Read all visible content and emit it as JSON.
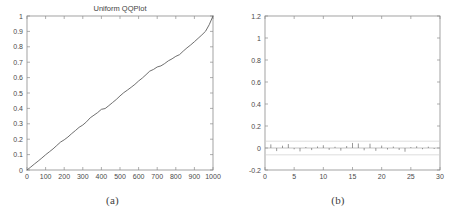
{
  "figure": {
    "panel_a_caption": "(a)",
    "panel_b_caption": "(b)"
  },
  "chart_data": [
    {
      "type": "line",
      "panel": "(a)",
      "title": "Uniform QQPlot",
      "xlabel": "",
      "ylabel": "",
      "xlim": [
        0,
        1000
      ],
      "ylim": [
        0,
        1
      ],
      "grid": false,
      "legend": null,
      "xticks": [
        0,
        100,
        200,
        300,
        400,
        500,
        600,
        700,
        800,
        900,
        1000
      ],
      "xtick_labels": [
        "0",
        "100",
        "200",
        "300",
        "400",
        "500",
        "600",
        "700",
        "800",
        "900",
        "1000"
      ],
      "yticks": [
        0,
        0.1,
        0.2,
        0.3,
        0.4,
        0.5,
        0.6,
        0.7,
        0.8,
        0.9,
        1
      ],
      "ytick_labels": [
        "0",
        "0.1",
        "0.2",
        "0.3",
        "0.4",
        "0.5",
        "0.6",
        "0.7",
        "0.8",
        "0.9",
        "1"
      ],
      "x": [
        0,
        20,
        40,
        60,
        80,
        100,
        120,
        140,
        160,
        180,
        200,
        220,
        240,
        260,
        280,
        300,
        320,
        340,
        360,
        380,
        400,
        420,
        440,
        460,
        480,
        500,
        520,
        540,
        560,
        580,
        600,
        620,
        640,
        660,
        680,
        700,
        720,
        740,
        760,
        780,
        800,
        820,
        840,
        860,
        880,
        900,
        920,
        940,
        960,
        980,
        1000
      ],
      "y": [
        0.0,
        0.019,
        0.039,
        0.058,
        0.078,
        0.099,
        0.118,
        0.137,
        0.159,
        0.181,
        0.196,
        0.214,
        0.236,
        0.256,
        0.277,
        0.292,
        0.313,
        0.339,
        0.356,
        0.373,
        0.394,
        0.399,
        0.418,
        0.438,
        0.458,
        0.481,
        0.502,
        0.519,
        0.537,
        0.556,
        0.578,
        0.597,
        0.619,
        0.642,
        0.653,
        0.669,
        0.676,
        0.691,
        0.709,
        0.722,
        0.738,
        0.749,
        0.772,
        0.793,
        0.812,
        0.833,
        0.855,
        0.877,
        0.901,
        0.944,
        1.0
      ]
    },
    {
      "type": "bar",
      "panel": "(b)",
      "title": "",
      "xlabel": "",
      "ylabel": "",
      "xlim": [
        0,
        30
      ],
      "ylim": [
        -0.2,
        1.2
      ],
      "grid": false,
      "legend": null,
      "xticks": [
        0,
        5,
        10,
        15,
        20,
        25,
        30
      ],
      "xtick_labels": [
        "0",
        "5",
        "10",
        "15",
        "20",
        "25",
        "30"
      ],
      "yticks": [
        -0.2,
        0,
        0.2,
        0.4,
        0.6,
        0.8,
        1,
        1.2
      ],
      "ytick_labels": [
        "-0.2",
        "0",
        "0.2",
        "0.4",
        "0.6",
        "0.8",
        "1",
        "1.2"
      ],
      "confidence_bounds": [
        -0.062,
        0.062
      ],
      "categories": [
        1,
        2,
        3,
        4,
        5,
        6,
        7,
        8,
        9,
        10,
        11,
        12,
        13,
        14,
        15,
        16,
        17,
        18,
        19,
        20,
        21,
        22,
        23,
        24,
        25,
        26,
        27,
        28,
        29
      ],
      "values": [
        0.033,
        -0.028,
        0.021,
        0.036,
        -0.012,
        -0.031,
        0.009,
        -0.019,
        0.014,
        0.025,
        -0.017,
        0.011,
        -0.024,
        0.018,
        0.046,
        0.041,
        -0.021,
        0.039,
        -0.026,
        0.022,
        -0.014,
        0.013,
        -0.018,
        -0.034,
        0.008,
        0.016,
        -0.011,
        0.012,
        -0.009
      ]
    }
  ]
}
